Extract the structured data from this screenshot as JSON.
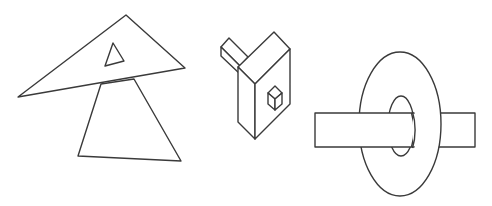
{
  "figure": {
    "line_color": "#3a3a3a",
    "background": "#ffffff",
    "panels": [
      {
        "id": "triangles",
        "label": "overlapping-triangles"
      },
      {
        "id": "block",
        "label": "isometric-block-with-cube"
      },
      {
        "id": "ring",
        "label": "ring-with-bar"
      }
    ]
  }
}
